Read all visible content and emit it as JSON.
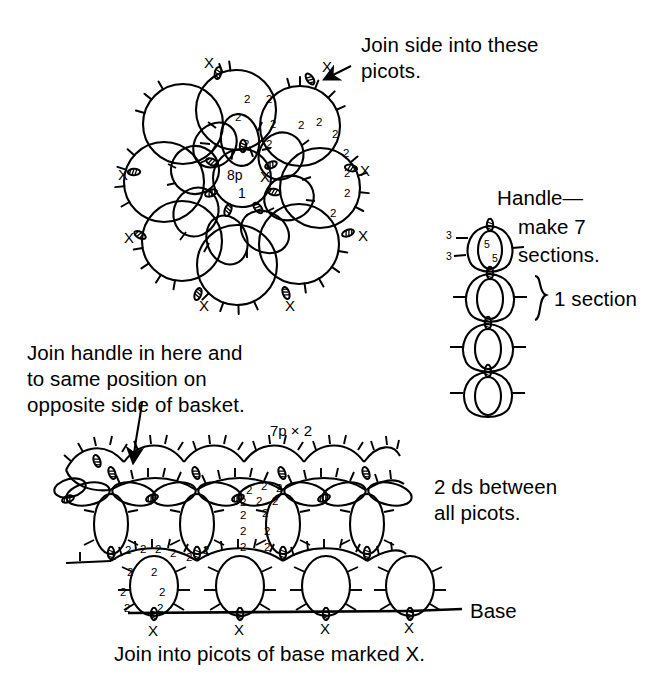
{
  "diagram": {
    "type": "tatting-pattern-schematic",
    "background_color": "#ffffff",
    "ink_color": "#000000"
  },
  "notes": {
    "join_side_picots": "Join side into these\npicots.",
    "join_side_picots_line1": "Join side into these",
    "join_side_picots_line2": "picots.",
    "handle_make": "Handle—\nmake 7\nsections.",
    "handle_line1": "Handle—",
    "handle_line2": "make 7",
    "handle_line3": "sections.",
    "one_section": "1 section",
    "join_handle_line1": "Join handle in here and",
    "join_handle_line2": "to same position on",
    "join_handle_line3": "opposite side of basket.",
    "ds_between_line1": "2 ds between",
    "ds_between_line2": "all picots.",
    "base_label": "Base",
    "bottom_caption": "Join into picots of base marked X."
  },
  "rosette": {
    "center_ring": {
      "picot_count": "8p",
      "ring_number": "1",
      "join_mark": "X"
    },
    "stitch_counts": [
      "2",
      "2",
      "2",
      "2",
      "2",
      "2",
      "2",
      "2",
      "2",
      "2",
      "2",
      "2"
    ],
    "join_marks": [
      "X",
      "X",
      "X",
      "X",
      "X",
      "X"
    ],
    "outer_ring_count": 8,
    "inner_petal_count": 8
  },
  "handle": {
    "heading": "Handle—",
    "sections_total": "7",
    "section_bracket_label": "1 section",
    "chain_counts_left": [
      "3",
      "3"
    ],
    "ring_counts_inner": [
      "5",
      "5"
    ],
    "rings_drawn": 4
  },
  "basket_side": {
    "top_arc_label": "7p × 2",
    "stitch_counts_mid": [
      "2",
      "2",
      "2",
      "2",
      "2",
      "2",
      "2",
      "2"
    ],
    "stitch_counts_lower": [
      "2",
      "2",
      "2",
      "2",
      "2",
      "2",
      "2",
      "2",
      "2",
      "2"
    ],
    "base_joins": [
      "X",
      "X",
      "X",
      "X"
    ],
    "motif_repeats": 4
  },
  "icons": {
    "arrow_to_picot": "arrow-icon",
    "arrow_to_handle_join": "arrow-icon",
    "section_brace": "brace-icon"
  }
}
